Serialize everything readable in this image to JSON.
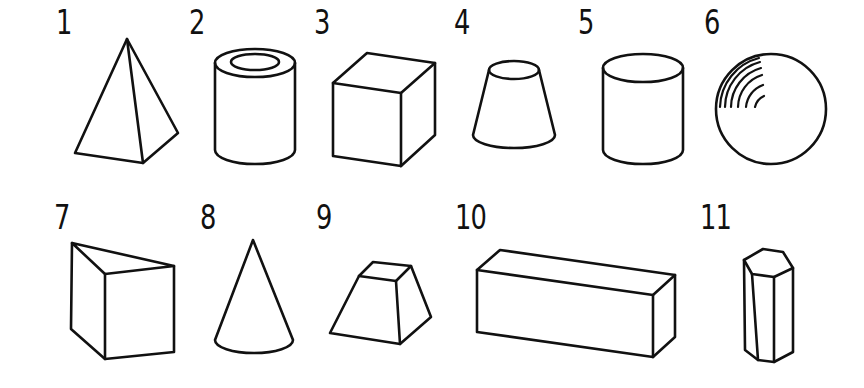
{
  "colors": {
    "stroke": "#111111",
    "background": "#ffffff"
  },
  "shapes": [
    {
      "label": "1",
      "name": "square-pyramid"
    },
    {
      "label": "2",
      "name": "hollow-cylinder"
    },
    {
      "label": "3",
      "name": "cube"
    },
    {
      "label": "4",
      "name": "truncated-cone"
    },
    {
      "label": "5",
      "name": "cylinder"
    },
    {
      "label": "6",
      "name": "sphere"
    },
    {
      "label": "7",
      "name": "triangular-prism"
    },
    {
      "label": "8",
      "name": "cone"
    },
    {
      "label": "9",
      "name": "truncated-pyramid"
    },
    {
      "label": "10",
      "name": "rectangular-prism"
    },
    {
      "label": "11",
      "name": "hexagonal-prism"
    }
  ]
}
